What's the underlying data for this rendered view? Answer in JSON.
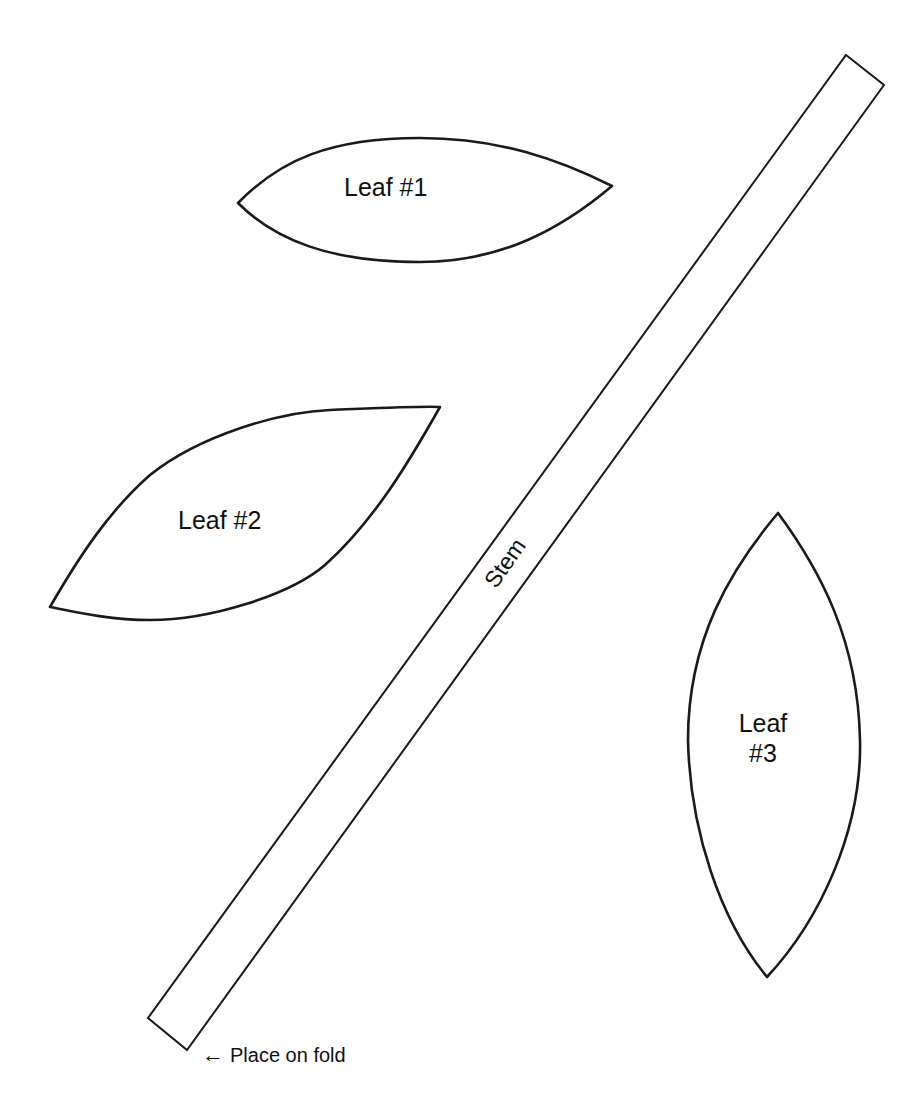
{
  "document": {
    "type": "craft pattern template",
    "pieces": [
      {
        "id": "leaf1",
        "label": "Leaf #1"
      },
      {
        "id": "leaf2",
        "label": "Leaf #2"
      },
      {
        "id": "leaf3",
        "label_line1": "Leaf",
        "label_line2": "#3"
      },
      {
        "id": "stem",
        "label": "Stem"
      }
    ],
    "fold_note": {
      "arrow": "←",
      "text": "Place on fold"
    },
    "colors": {
      "background": "#ffffff",
      "outline": "#1a1a1a",
      "text": "#111111"
    }
  }
}
